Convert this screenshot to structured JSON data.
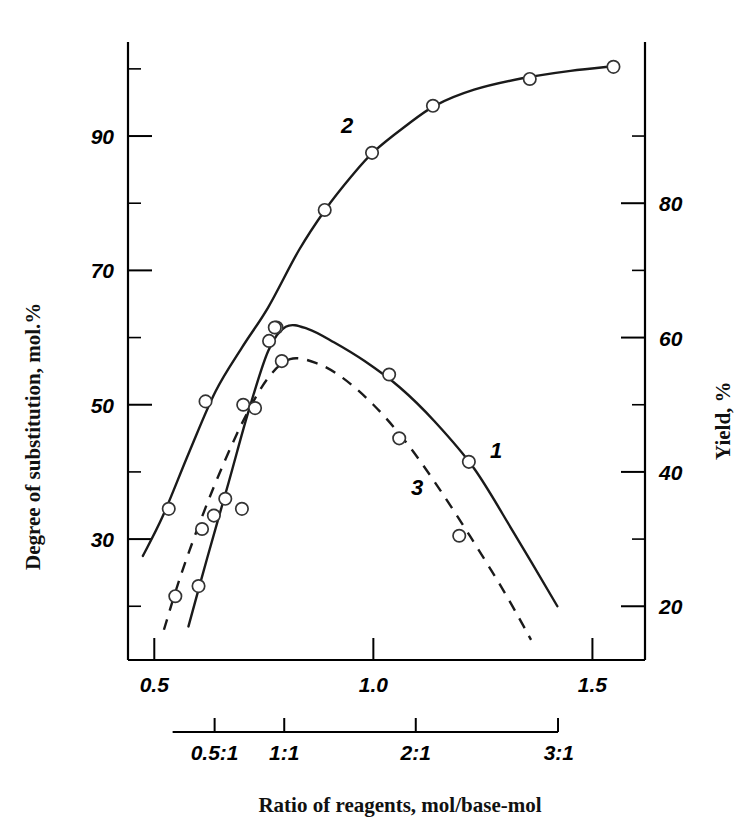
{
  "chart_data": {
    "type": "line",
    "title": "",
    "xlabel": "Ratio of reagents, mol/base-mol",
    "ylabel_left": "Degree of substitution, mol.%",
    "ylabel_right": "Yield, %",
    "xlim": [
      0.44,
      1.62
    ],
    "ylim_left": [
      12,
      104
    ],
    "ylim_right": [
      12,
      104
    ],
    "grid": false,
    "legend_position": "inline-curve-labels",
    "x_ticks": [
      "0.5",
      "1.0",
      "1.5"
    ],
    "x_tick_values": [
      0.5,
      1.0,
      1.5
    ],
    "x_minor_count_between": 0,
    "y_left_ticks": [
      "90",
      "70",
      "50",
      "30"
    ],
    "y_left_tick_values": [
      90,
      70,
      50,
      30
    ],
    "y_left_minor_values": [
      100,
      80,
      60,
      40,
      20
    ],
    "y_right_ticks": [
      "80",
      "60",
      "40",
      "20"
    ],
    "y_right_tick_values": [
      80,
      60,
      40,
      20
    ],
    "y_right_minor_values": [
      90,
      70,
      50,
      30
    ],
    "secondary_axis": {
      "label": "Ratio of reagents, mol/base-mol",
      "ticks": [
        "0.5:1",
        "1:1",
        "2:1",
        "3:1"
      ],
      "tick_x_positions": [
        0.6377,
        0.7966,
        1.0968,
        1.4215
      ]
    },
    "series": [
      {
        "name": "1",
        "label": "1",
        "axis": "left",
        "style": "solid",
        "description": "Degree of substitution - peaked curve",
        "points": [
          {
            "x": 0.601,
            "y": 23.0
          },
          {
            "x": 0.636,
            "y": 33.5
          },
          {
            "x": 0.7,
            "y": 34.5
          },
          {
            "x": 0.762,
            "y": 59.5
          },
          {
            "x": 0.779,
            "y": 61.5
          },
          {
            "x": 1.036,
            "y": 54.5
          },
          {
            "x": 1.218,
            "y": 41.5
          }
        ],
        "curve": [
          {
            "x": 0.578,
            "y": 17.0
          },
          {
            "x": 0.62,
            "y": 27.0
          },
          {
            "x": 0.67,
            "y": 38.5
          },
          {
            "x": 0.715,
            "y": 49.0
          },
          {
            "x": 0.76,
            "y": 58.0
          },
          {
            "x": 0.8,
            "y": 61.6
          },
          {
            "x": 0.85,
            "y": 61.3
          },
          {
            "x": 0.91,
            "y": 59.3
          },
          {
            "x": 0.98,
            "y": 56.5
          },
          {
            "x": 1.06,
            "y": 52.6
          },
          {
            "x": 1.14,
            "y": 47.5
          },
          {
            "x": 1.23,
            "y": 40.5
          },
          {
            "x": 1.32,
            "y": 31.0
          },
          {
            "x": 1.42,
            "y": 20.0
          }
        ]
      },
      {
        "name": "2",
        "label": "2",
        "axis": "left",
        "style": "solid",
        "description": "Degree of substitution - rising saturating curve",
        "points": [
          {
            "x": 0.533,
            "y": 34.5
          },
          {
            "x": 0.617,
            "y": 50.5
          },
          {
            "x": 0.703,
            "y": 50.0
          },
          {
            "x": 0.775,
            "y": 61.5
          },
          {
            "x": 0.889,
            "y": 79.0
          },
          {
            "x": 0.997,
            "y": 87.5
          },
          {
            "x": 1.136,
            "y": 94.5
          },
          {
            "x": 1.357,
            "y": 98.5
          },
          {
            "x": 1.548,
            "y": 100.3
          }
        ],
        "curve": [
          {
            "x": 0.474,
            "y": 27.5
          },
          {
            "x": 0.52,
            "y": 33.5
          },
          {
            "x": 0.58,
            "y": 43.0
          },
          {
            "x": 0.64,
            "y": 52.0
          },
          {
            "x": 0.7,
            "y": 58.5
          },
          {
            "x": 0.76,
            "y": 64.5
          },
          {
            "x": 0.83,
            "y": 73.0
          },
          {
            "x": 0.89,
            "y": 79.0
          },
          {
            "x": 0.95,
            "y": 84.0
          },
          {
            "x": 1.0,
            "y": 87.6
          },
          {
            "x": 1.07,
            "y": 91.3
          },
          {
            "x": 1.14,
            "y": 94.5
          },
          {
            "x": 1.23,
            "y": 96.9
          },
          {
            "x": 1.34,
            "y": 98.6
          },
          {
            "x": 1.45,
            "y": 99.7
          },
          {
            "x": 1.55,
            "y": 100.4
          }
        ]
      },
      {
        "name": "3",
        "label": "3",
        "axis": "left",
        "style": "dashed",
        "description": "Yield - dashed peaked curve",
        "points": [
          {
            "x": 0.548,
            "y": 21.5
          },
          {
            "x": 0.609,
            "y": 31.5
          },
          {
            "x": 0.662,
            "y": 36.0
          },
          {
            "x": 0.73,
            "y": 49.5
          },
          {
            "x": 0.791,
            "y": 56.5
          },
          {
            "x": 1.059,
            "y": 45.0
          },
          {
            "x": 1.196,
            "y": 30.5
          }
        ],
        "curve": [
          {
            "x": 0.522,
            "y": 16.5
          },
          {
            "x": 0.56,
            "y": 24.5
          },
          {
            "x": 0.61,
            "y": 33.5
          },
          {
            "x": 0.66,
            "y": 41.5
          },
          {
            "x": 0.71,
            "y": 48.5
          },
          {
            "x": 0.76,
            "y": 54.0
          },
          {
            "x": 0.81,
            "y": 56.8
          },
          {
            "x": 0.87,
            "y": 56.2
          },
          {
            "x": 0.93,
            "y": 54.0
          },
          {
            "x": 1.0,
            "y": 50.0
          },
          {
            "x": 1.07,
            "y": 44.8
          },
          {
            "x": 1.14,
            "y": 38.5
          },
          {
            "x": 1.22,
            "y": 30.5
          },
          {
            "x": 1.3,
            "y": 22.0
          },
          {
            "x": 1.36,
            "y": 15.0
          }
        ]
      }
    ],
    "curve_labels": [
      {
        "text": "1",
        "x": 1.28,
        "y": 42.0
      },
      {
        "text": "2",
        "x": 0.94,
        "y": 90.5
      },
      {
        "text": "3",
        "x": 1.1,
        "y": 36.5
      }
    ]
  }
}
